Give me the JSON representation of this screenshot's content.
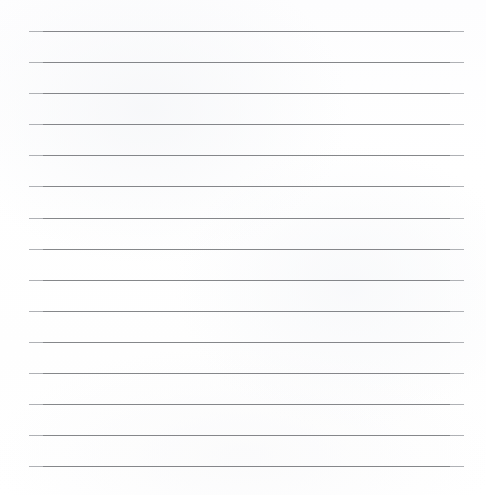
{
  "document": {
    "kind": "lined-paper-sheet",
    "title": "Blank ruled paper",
    "width": 486,
    "height": 495,
    "background_color": "#ffffff",
    "paper_tint_color": "#fdfdfe",
    "content_text": ""
  },
  "ruling": {
    "line_count": 15,
    "line_color": "#7b7d81",
    "line_end_color": "#a9abaf",
    "line_thickness": 1,
    "left_margin": 29,
    "right_margin": 22,
    "line_length": 435,
    "first_line_y": 31,
    "last_line_y": 466,
    "line_spacing": 31.07,
    "orientation": "horizontal",
    "lines_y": [
      31,
      62,
      93,
      124,
      155,
      186,
      218,
      249,
      280,
      311,
      342,
      373,
      404,
      435,
      466
    ]
  }
}
